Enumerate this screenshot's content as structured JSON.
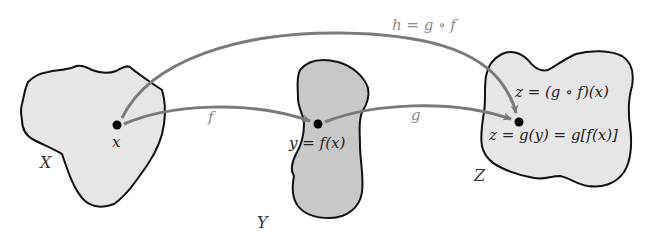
{
  "diagram": {
    "colors": {
      "background": "#ffffff",
      "set_x_fill": "#e6e6e6",
      "set_y_fill": "#c8c8c8",
      "set_z_fill": "#e6e6e6",
      "outline": "#111111",
      "arrow": "#7a7a7a",
      "arrow_label": "#8a8a8a",
      "point": "#000000"
    },
    "sets": [
      {
        "id": "X",
        "label": "X",
        "point_label": "x"
      },
      {
        "id": "Y",
        "label": "Y",
        "point_label": "y = f(x)"
      },
      {
        "id": "Z",
        "label": "Z",
        "point_label_top": "z = (g ∘ f)(x)",
        "point_label_bottom": "z = g(y) = g[f(x)]"
      }
    ],
    "arrows": [
      {
        "id": "f",
        "from": "x",
        "to": "y",
        "label": "f"
      },
      {
        "id": "g",
        "from": "y",
        "to": "z",
        "label": "g"
      },
      {
        "id": "h",
        "from": "x",
        "to": "z",
        "label": "h = g ∘ f"
      }
    ]
  }
}
